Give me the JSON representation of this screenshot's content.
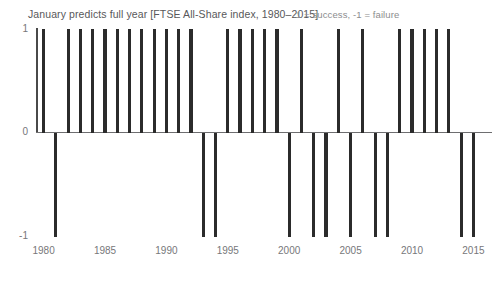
{
  "chart_title": "January predicts full year [FTSE All-Share index, 1980–2015]",
  "legend_note": "1 = success, -1 = failure",
  "axis": {
    "y_top_label": "1",
    "y_zero_label": "0",
    "y_bottom_label": "-1",
    "x_ticks": [
      "1980",
      "1985",
      "1990",
      "1995",
      "2000",
      "2005",
      "2010",
      "2015"
    ]
  },
  "colors": {
    "bar": "#2b2b2b",
    "axis": "#6e6e70",
    "title_text": "#58585a",
    "legend_text": "#8c8c8e",
    "tick_text": "#77777a",
    "background": "#ffffff"
  },
  "chart_data": {
    "type": "bar",
    "title": "January predicts full year [FTSE All-Share index, 1980–2015]",
    "subtitle": "1 = success, -1 = failure",
    "xlabel": "",
    "ylabel": "",
    "ylim": [
      -1,
      1
    ],
    "yticks": [
      -1,
      0,
      1
    ],
    "grid": false,
    "legend_position": "top-right",
    "annotations": [
      "1 = success, -1 = failure"
    ],
    "categories": [
      "1980",
      "1981",
      "1982",
      "1983",
      "1984",
      "1985",
      "1986",
      "1987",
      "1988",
      "1989",
      "1990",
      "1991",
      "1992",
      "1993",
      "1994",
      "1995",
      "1996",
      "1997",
      "1998",
      "1999",
      "2000",
      "2001",
      "2002",
      "2003",
      "2004",
      "2005",
      "2006",
      "2007",
      "2008",
      "2009",
      "2010",
      "2011",
      "2012",
      "2013",
      "2014",
      "2015"
    ],
    "values": [
      1,
      -1,
      1,
      1,
      1,
      1,
      1,
      1,
      1,
      1,
      1,
      1,
      1,
      -1,
      -1,
      1,
      1,
      1,
      1,
      1,
      -1,
      1,
      -1,
      -1,
      1,
      -1,
      1,
      -1,
      -1,
      1,
      1,
      1,
      1,
      1,
      -1,
      -1
    ]
  }
}
